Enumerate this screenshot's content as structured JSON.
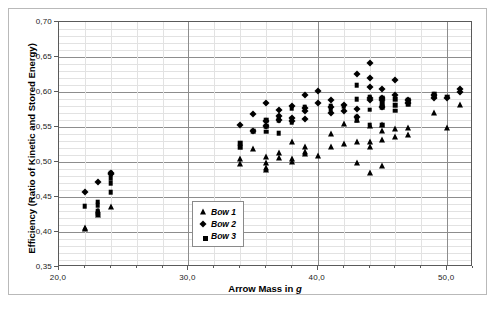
{
  "chart_data": {
    "type": "scatter",
    "title": "",
    "xlabel": "Arrow Mass in g",
    "xlabel_italic_tail": "g",
    "ylabel": "Efficiency (Ratio of Kinetic and Stored Energy)",
    "xlim": [
      20.0,
      52.0
    ],
    "ylim": [
      0.35,
      0.7
    ],
    "xticks": [
      20.0,
      30.0,
      40.0,
      50.0
    ],
    "xticklabels": [
      "20,0",
      "30,0",
      "40,0",
      "50,0"
    ],
    "xminor_step": 2.0,
    "yticks": [
      0.35,
      0.4,
      0.45,
      0.5,
      0.55,
      0.6,
      0.65,
      0.7
    ],
    "yticklabels": [
      "0,35",
      "0,40",
      "0,45",
      "0,50",
      "0,55",
      "0,60",
      "0,65",
      "0,70"
    ],
    "yminor_step": 0.01,
    "grid": true,
    "legend_position": "center-left-inside",
    "marker_color": "#000000",
    "gridline_major_color": "#8d8d8d",
    "gridline_minor_color": "#e2e2e2",
    "axis_color": "#5a5a5a",
    "series": [
      {
        "name": "Bow 1",
        "marker": "triangle",
        "points": [
          [
            22.0,
            0.406
          ],
          [
            22.0,
            0.404
          ],
          [
            23.0,
            0.43
          ],
          [
            23.0,
            0.427
          ],
          [
            23.0,
            0.425
          ],
          [
            24.0,
            0.436
          ],
          [
            34.0,
            0.504
          ],
          [
            34.0,
            0.497
          ],
          [
            35.0,
            0.519
          ],
          [
            36.0,
            0.507
          ],
          [
            36.0,
            0.499
          ],
          [
            36.0,
            0.492
          ],
          [
            36.0,
            0.489
          ],
          [
            37.0,
            0.513
          ],
          [
            37.0,
            0.506
          ],
          [
            38.0,
            0.528
          ],
          [
            38.0,
            0.504
          ],
          [
            38.0,
            0.5
          ],
          [
            39.0,
            0.522
          ],
          [
            39.0,
            0.515
          ],
          [
            39.0,
            0.512
          ],
          [
            40.0,
            0.508
          ],
          [
            41.0,
            0.54
          ],
          [
            41.0,
            0.522
          ],
          [
            42.0,
            0.555
          ],
          [
            42.0,
            0.526
          ],
          [
            43.0,
            0.56
          ],
          [
            43.0,
            0.528
          ],
          [
            43.0,
            0.499
          ],
          [
            44.0,
            0.551
          ],
          [
            44.0,
            0.528
          ],
          [
            44.0,
            0.522
          ],
          [
            44.0,
            0.484
          ],
          [
            45.0,
            0.553
          ],
          [
            45.0,
            0.545
          ],
          [
            45.0,
            0.532
          ],
          [
            45.0,
            0.494
          ],
          [
            46.0,
            0.547
          ],
          [
            46.0,
            0.536
          ],
          [
            47.0,
            0.548
          ],
          [
            47.0,
            0.538
          ],
          [
            49.0,
            0.57
          ],
          [
            50.0,
            0.549
          ],
          [
            51.0,
            0.582
          ]
        ]
      },
      {
        "name": "Bow 2",
        "marker": "diamond",
        "points": [
          [
            22.0,
            0.457
          ],
          [
            23.0,
            0.471
          ],
          [
            24.0,
            0.485
          ],
          [
            24.0,
            0.483
          ],
          [
            34.0,
            0.553
          ],
          [
            35.0,
            0.569
          ],
          [
            35.0,
            0.545
          ],
          [
            36.0,
            0.585
          ],
          [
            36.0,
            0.559
          ],
          [
            36.0,
            0.552
          ],
          [
            37.0,
            0.574
          ],
          [
            37.0,
            0.566
          ],
          [
            37.0,
            0.56
          ],
          [
            38.0,
            0.58
          ],
          [
            38.0,
            0.563
          ],
          [
            38.0,
            0.559
          ],
          [
            39.0,
            0.596
          ],
          [
            39.0,
            0.577
          ],
          [
            39.0,
            0.573
          ],
          [
            39.0,
            0.562
          ],
          [
            40.0,
            0.601
          ],
          [
            40.0,
            0.585
          ],
          [
            41.0,
            0.588
          ],
          [
            41.0,
            0.578
          ],
          [
            41.0,
            0.57
          ],
          [
            42.0,
            0.582
          ],
          [
            42.0,
            0.573
          ],
          [
            43.0,
            0.626
          ],
          [
            43.0,
            0.576
          ],
          [
            43.0,
            0.565
          ],
          [
            44.0,
            0.641
          ],
          [
            44.0,
            0.62
          ],
          [
            44.0,
            0.607
          ],
          [
            44.0,
            0.592
          ],
          [
            44.0,
            0.589
          ],
          [
            45.0,
            0.604
          ],
          [
            45.0,
            0.592
          ],
          [
            45.0,
            0.588
          ],
          [
            45.0,
            0.578
          ],
          [
            46.0,
            0.617
          ],
          [
            46.0,
            0.596
          ],
          [
            47.0,
            0.588
          ],
          [
            47.0,
            0.585
          ],
          [
            49.0,
            0.596
          ],
          [
            49.0,
            0.591
          ],
          [
            50.0,
            0.592
          ],
          [
            51.0,
            0.604
          ],
          [
            51.0,
            0.6
          ]
        ]
      },
      {
        "name": "Bow 3",
        "marker": "square",
        "points": [
          [
            22.0,
            0.437
          ],
          [
            23.0,
            0.443
          ],
          [
            23.0,
            0.438
          ],
          [
            23.0,
            0.43
          ],
          [
            23.0,
            0.427
          ],
          [
            24.0,
            0.484
          ],
          [
            24.0,
            0.477
          ],
          [
            24.0,
            0.47
          ],
          [
            24.0,
            0.457
          ],
          [
            34.0,
            0.527
          ],
          [
            34.0,
            0.521
          ],
          [
            35.0,
            0.544
          ],
          [
            36.0,
            0.56
          ],
          [
            36.0,
            0.551
          ],
          [
            36.0,
            0.543
          ],
          [
            37.0,
            0.564
          ],
          [
            37.0,
            0.56
          ],
          [
            37.0,
            0.541
          ],
          [
            38.0,
            0.577
          ],
          [
            38.0,
            0.562
          ],
          [
            38.0,
            0.557
          ],
          [
            39.0,
            0.578
          ],
          [
            41.0,
            0.58
          ],
          [
            41.0,
            0.575
          ],
          [
            42.0,
            0.58
          ],
          [
            43.0,
            0.61
          ],
          [
            43.0,
            0.59
          ],
          [
            43.0,
            0.565
          ],
          [
            43.0,
            0.56
          ],
          [
            44.0,
            0.593
          ],
          [
            44.0,
            0.575
          ],
          [
            44.0,
            0.553
          ],
          [
            45.0,
            0.592
          ],
          [
            45.0,
            0.584
          ],
          [
            45.0,
            0.578
          ],
          [
            45.0,
            0.553
          ],
          [
            46.0,
            0.59
          ],
          [
            46.0,
            0.581
          ],
          [
            46.0,
            0.573
          ],
          [
            47.0,
            0.589
          ],
          [
            47.0,
            0.586
          ],
          [
            47.0,
            0.582
          ],
          [
            49.0,
            0.597
          ],
          [
            49.0,
            0.593
          ],
          [
            50.0,
            0.593
          ]
        ]
      }
    ]
  }
}
